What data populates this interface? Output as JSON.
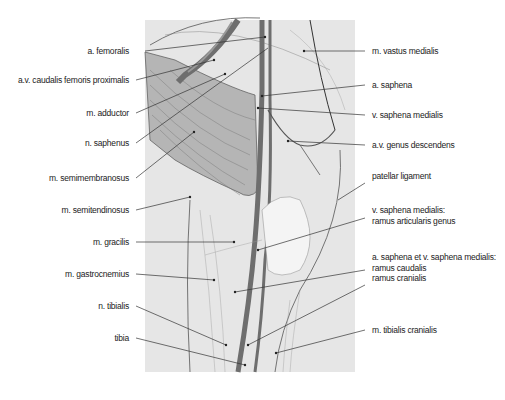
{
  "figure": {
    "colors": {
      "background": "#ffffff",
      "panel": "#e6e6e6",
      "muscle_shaded": "#b5b5b5",
      "vessel": "#6e6e6e",
      "line": "#333333"
    }
  },
  "labels_left": [
    {
      "id": "a-femoralis",
      "text": "a. femoralis"
    },
    {
      "id": "av-caudalis-femoris-proximalis",
      "text": "a.v. caudalis femoris proximalis"
    },
    {
      "id": "m-adductor",
      "text": "m. adductor"
    },
    {
      "id": "n-saphenus",
      "text": "n. saphenus"
    },
    {
      "id": "m-semimembranosus",
      "text": "m. semimembranosus"
    },
    {
      "id": "m-semitendinosus",
      "text": "m. semitendinosus"
    },
    {
      "id": "m-gracilis",
      "text": "m. gracilis"
    },
    {
      "id": "m-gastrocnemius",
      "text": "m. gastrocnemius"
    },
    {
      "id": "n-tibialis",
      "text": "n. tibialis"
    },
    {
      "id": "tibia",
      "text": "tibia"
    }
  ],
  "labels_right": [
    {
      "id": "m-vastus-medialis",
      "text": "m. vastus medialis"
    },
    {
      "id": "a-saphena",
      "text": "a. saphena"
    },
    {
      "id": "v-saphena-medialis",
      "text": "v. saphena medialis"
    },
    {
      "id": "av-genus-descendens",
      "text": "a.v. genus descendens"
    },
    {
      "id": "patellar-ligament",
      "text": "patellar ligament"
    },
    {
      "id": "v-saphena-ramus-articularis",
      "lines": [
        "v. saphena medialis:",
        "ramus articularis genus"
      ]
    },
    {
      "id": "a-v-saphena-rami",
      "lines": [
        "a. saphena et v. saphena medialis:",
        "ramus caudalis",
        "ramus cranialis"
      ]
    },
    {
      "id": "m-tibialis-cranialis",
      "text": "m. tibialis cranialis"
    }
  ]
}
